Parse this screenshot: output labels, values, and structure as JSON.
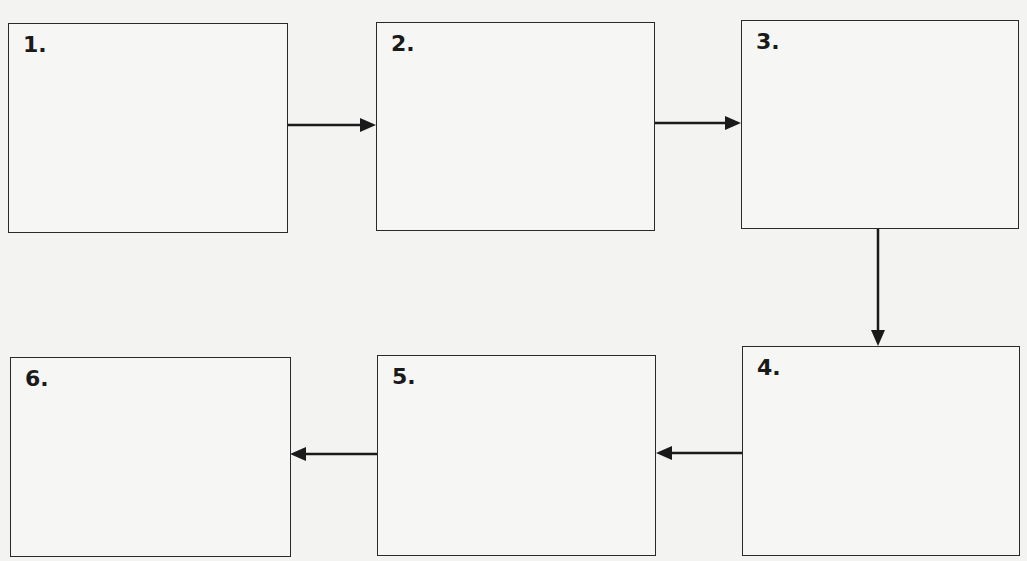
{
  "diagram": {
    "type": "flowchart",
    "steps": [
      {
        "id": 1,
        "label": "1."
      },
      {
        "id": 2,
        "label": "2."
      },
      {
        "id": 3,
        "label": "3."
      },
      {
        "id": 4,
        "label": "4."
      },
      {
        "id": 5,
        "label": "5."
      },
      {
        "id": 6,
        "label": "6."
      }
    ],
    "connections": [
      {
        "from": 1,
        "to": 2
      },
      {
        "from": 2,
        "to": 3
      },
      {
        "from": 3,
        "to": 4
      },
      {
        "from": 4,
        "to": 5
      },
      {
        "from": 5,
        "to": 6
      }
    ]
  }
}
